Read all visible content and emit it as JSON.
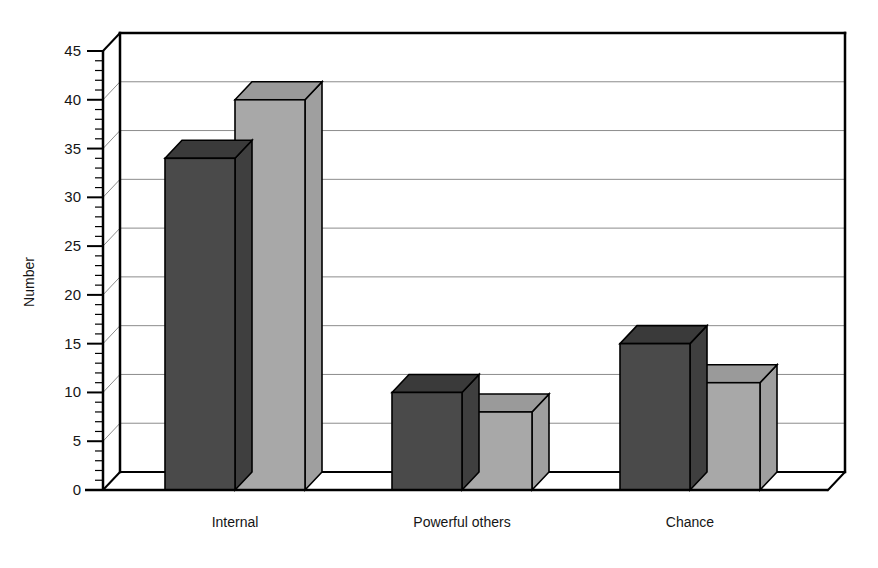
{
  "chart_data": {
    "type": "bar",
    "title": "",
    "subtitle": "",
    "xlabel": "",
    "ylabel": "Number",
    "categories": [
      "Internal",
      "Powerful others",
      "Chance"
    ],
    "series": [
      {
        "name": "series-1",
        "color": "#4a4a4a",
        "values": [
          34,
          10,
          15
        ]
      },
      {
        "name": "series-2",
        "color": "#a8a8a8",
        "values": [
          40,
          8,
          11
        ]
      }
    ],
    "ylim": [
      0,
      45
    ],
    "ytick_labels": [
      "0",
      "5",
      "10",
      "15",
      "20",
      "25",
      "30",
      "35",
      "40",
      "45"
    ],
    "ytick_values": [
      0,
      5,
      10,
      15,
      20,
      25,
      30,
      35,
      40,
      45
    ],
    "ytick_minor_step": 1,
    "grid": true,
    "grid_axis": "y",
    "legend": "none",
    "style": "3d-grouped-bar",
    "colors": {
      "series_1_front": "#4a4a4a",
      "series_1_top": "#3a3a3a",
      "series_1_side": "#3f3f3f",
      "series_2_front": "#a8a8a8",
      "series_2_top": "#9a9a9a",
      "series_2_side": "#9f9f9f",
      "frame": "#000000",
      "gridline": "#8c8c8c",
      "background": "#ffffff"
    }
  },
  "axis": {
    "y_title": "Number"
  }
}
